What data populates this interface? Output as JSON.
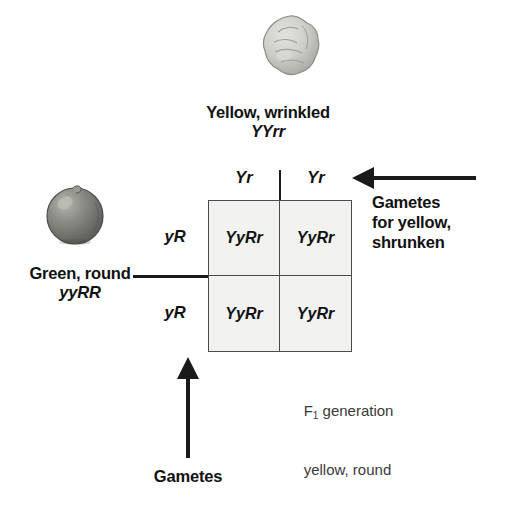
{
  "diagram": {
    "colors": {
      "ink": "#1a1a1a",
      "grid_line": "#4a4a4a",
      "cell_fill": "#f2f2f0",
      "wrinkled_seed": "#c9c9c4",
      "round_seed": "#7a7a76",
      "caption_gray": "#3a3a3a"
    }
  },
  "top_parent": {
    "phenotype": "Yellow, wrinkled",
    "genotype": "YYrr",
    "seed_icon": "wrinkled-pea-seed-icon"
  },
  "left_parent": {
    "phenotype": "Green, round",
    "genotype": "yyRR",
    "seed_icon": "round-pea-seed-icon"
  },
  "gametes": {
    "columns": [
      "Yr",
      "Yr"
    ],
    "rows": [
      "yR",
      "yR"
    ]
  },
  "punnett": {
    "cells": [
      "YyRr",
      "YyRr",
      "YyRr",
      "YyRr"
    ]
  },
  "annotations": {
    "right_arrow_label": "Gametes\nfor yellow,\nshrunken",
    "bottom_arrow_label": "Gametes",
    "offspring_line1_prefix": "F",
    "offspring_line1_sub": "1",
    "offspring_line1_suffix": " generation",
    "offspring_line2": "yellow, round"
  }
}
